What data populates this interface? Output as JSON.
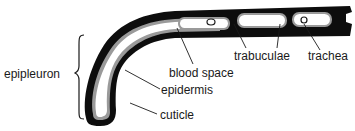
{
  "diagram": {
    "labels": {
      "epipleuron": "epipleuron",
      "blood_space": "blood space",
      "epidermis": "epidermis",
      "cuticle": "cuticle",
      "trabuculae": "trabuculae",
      "trachea": "trachea"
    },
    "colors": {
      "cuticle": "#0d0d0d",
      "epidermis": "#9a9a9a",
      "blood_space": "#ffffff",
      "leader_lines": "#1a1a1a"
    }
  }
}
